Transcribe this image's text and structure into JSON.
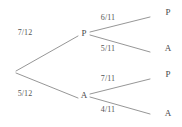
{
  "diagram": {
    "type": "probability-tree",
    "title": "",
    "colors": {
      "background": "#ffffff",
      "line": "#8a8a8a",
      "node_text": "#4a4a4a",
      "edge_text": "#555555"
    },
    "root": {
      "label": "",
      "x": 15,
      "y": 72
    },
    "nodes": [
      {
        "id": "level1-P",
        "label": "P",
        "x": 84,
        "y": 33,
        "level": 1
      },
      {
        "id": "level1-A",
        "label": "A",
        "x": 84,
        "y": 95,
        "level": 1
      },
      {
        "id": "leaf-PP",
        "label": "P",
        "x": 168,
        "y": 12,
        "level": 2
      },
      {
        "id": "leaf-PA",
        "label": "A",
        "x": 168,
        "y": 48,
        "level": 2
      },
      {
        "id": "leaf-AP",
        "label": "P",
        "x": 168,
        "y": 74,
        "level": 2
      },
      {
        "id": "leaf-AA",
        "label": "A",
        "x": 168,
        "y": 113,
        "level": 2
      }
    ],
    "edges": [
      {
        "id": "root-to-P",
        "from": "root",
        "to": "level1-P",
        "x1": 16,
        "y1": 71,
        "x2": 78,
        "y2": 36
      },
      {
        "id": "root-to-A",
        "from": "root",
        "to": "level1-A",
        "x1": 16,
        "y1": 73,
        "x2": 78,
        "y2": 98
      },
      {
        "id": "P-to-PP",
        "from": "level1-P",
        "to": "leaf-PP",
        "x1": 90,
        "y1": 32,
        "x2": 150,
        "y2": 17
      },
      {
        "id": "P-to-PA",
        "from": "level1-P",
        "to": "leaf-PA",
        "x1": 90,
        "y1": 35,
        "x2": 150,
        "y2": 52
      },
      {
        "id": "A-to-AP",
        "from": "level1-A",
        "to": "leaf-AP",
        "x1": 90,
        "y1": 94,
        "x2": 150,
        "y2": 79
      },
      {
        "id": "A-to-AA",
        "from": "level1-A",
        "to": "leaf-AA",
        "x1": 90,
        "y1": 97,
        "x2": 150,
        "y2": 114
      }
    ],
    "edge_labels": [
      {
        "id": "label-7-12",
        "edge": "root-to-P",
        "text": "7/12",
        "x": 25,
        "y": 33
      },
      {
        "id": "label-5-12",
        "edge": "root-to-A",
        "text": "5/12",
        "x": 25,
        "y": 94
      },
      {
        "id": "label-6-11",
        "edge": "P-to-PP",
        "text": "6/11",
        "x": 108,
        "y": 18
      },
      {
        "id": "label-5-11",
        "edge": "P-to-PA",
        "text": "5/11",
        "x": 108,
        "y": 49
      },
      {
        "id": "label-7-11",
        "edge": "A-to-AP",
        "text": "7/11",
        "x": 108,
        "y": 79
      },
      {
        "id": "label-4-11",
        "edge": "A-to-AA",
        "text": "4/11",
        "x": 108,
        "y": 110
      }
    ]
  },
  "chart_data": {
    "type": "tree",
    "title": "",
    "stage1": {
      "branches": [
        {
          "outcome": "P",
          "probability": "7/12",
          "value": 0.5833
        },
        {
          "outcome": "A",
          "probability": "5/12",
          "value": 0.4167
        }
      ]
    },
    "stage2": {
      "from_P": [
        {
          "outcome": "P",
          "probability": "6/11",
          "value": 0.5455
        },
        {
          "outcome": "A",
          "probability": "5/11",
          "value": 0.4545
        }
      ],
      "from_A": [
        {
          "outcome": "P",
          "probability": "7/11",
          "value": 0.6364
        },
        {
          "outcome": "A",
          "probability": "4/11",
          "value": 0.3636
        }
      ]
    },
    "paths": [
      {
        "sequence": "P,P",
        "probabilities": [
          "7/12",
          "6/11"
        ]
      },
      {
        "sequence": "P,A",
        "probabilities": [
          "7/12",
          "5/11"
        ]
      },
      {
        "sequence": "A,P",
        "probabilities": [
          "5/12",
          "7/11"
        ]
      },
      {
        "sequence": "A,A",
        "probabilities": [
          "5/12",
          "4/11"
        ]
      }
    ]
  }
}
